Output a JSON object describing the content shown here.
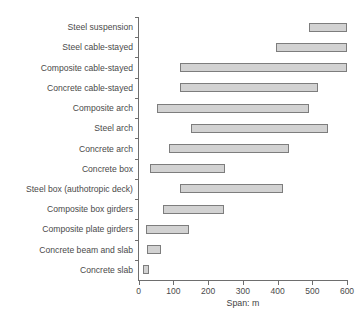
{
  "chart_data": {
    "type": "bar",
    "subtype": "horizontal-range",
    "title": "",
    "xlabel": "Span: m",
    "ylabel": "",
    "xlim": [
      0,
      600
    ],
    "xticks": [
      0,
      100,
      200,
      300,
      400,
      500,
      600
    ],
    "xtick_labels": [
      "0",
      "100",
      "200",
      "300",
      "400",
      "500",
      "600"
    ],
    "grid": false,
    "legend": null,
    "categories": [
      "Steel suspension",
      "Steel cable-stayed",
      "Composite cable-stayed",
      "Concrete cable-stayed",
      "Composite arch",
      "Steel arch",
      "Concrete arch",
      "Concrete box",
      "Steel box (authotropic deck)",
      "Composite box girders",
      "Composite plate girders",
      "Concrete beam and slab",
      "Concrete slab"
    ],
    "ranges": [
      {
        "category": "Steel suspension",
        "start": 490,
        "end": 600
      },
      {
        "category": "Steel cable-stayed",
        "start": 395,
        "end": 600
      },
      {
        "category": "Composite cable-stayed",
        "start": 120,
        "end": 600
      },
      {
        "category": "Concrete cable-stayed",
        "start": 120,
        "end": 517
      },
      {
        "category": "Composite arch",
        "start": 52,
        "end": 492
      },
      {
        "category": "Steel arch",
        "start": 150,
        "end": 545
      },
      {
        "category": "Concrete arch",
        "start": 88,
        "end": 434
      },
      {
        "category": "Concrete box",
        "start": 32,
        "end": 250
      },
      {
        "category": "Steel box (authotropic deck)",
        "start": 118,
        "end": 416
      },
      {
        "category": "Composite box girders",
        "start": 70,
        "end": 245
      },
      {
        "category": "Composite plate girders",
        "start": 21,
        "end": 146
      },
      {
        "category": "Concrete beam and slab",
        "start": 24,
        "end": 64
      },
      {
        "category": "Concrete slab",
        "start": 12,
        "end": 31
      }
    ],
    "colors": {
      "bar_fill": "#d2d2d2",
      "bar_border": "#7d7d7d",
      "axis": "#6e6e6e",
      "text": "#4a4a4a",
      "background": "#ffffff"
    }
  }
}
